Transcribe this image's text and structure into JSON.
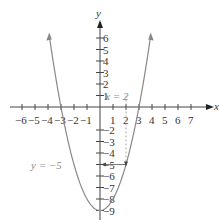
{
  "chart_data": {
    "type": "line",
    "title": "",
    "equation": "y = x^2 - 9",
    "xlabel": "x",
    "ylabel": "y",
    "xlim": [
      -7,
      7.5
    ],
    "ylim": [
      -9.5,
      7
    ],
    "x_ticks": [
      -6,
      -5,
      -4,
      -3,
      -2,
      -1,
      1,
      2,
      3,
      4,
      5,
      6,
      7
    ],
    "y_ticks": [
      6,
      5,
      4,
      3,
      2,
      1,
      -2,
      -3,
      -4,
      -5,
      -6,
      -7,
      -8,
      -9
    ],
    "grid": false,
    "series": [
      {
        "name": "parabola",
        "color": "#888888",
        "x": [
          -3.9,
          -3,
          -2,
          -1,
          0,
          1,
          2,
          3,
          3.9
        ],
        "y": [
          6.21,
          0,
          -5,
          -8,
          -9,
          -8,
          -5,
          0,
          6.21
        ]
      }
    ],
    "annotations": [
      {
        "label": "x = 2",
        "type": "dashed-vertical",
        "x": 2,
        "y_from": 1,
        "y_to": -5
      },
      {
        "label": "y = −5",
        "type": "arrow-horizontal",
        "y": -5,
        "x_from": 2,
        "x_to": 0
      }
    ]
  },
  "labels": {
    "x_axis": "x",
    "y_axis": "y",
    "x_eq_2": "x = 2",
    "y_eq_m5": "y = −5"
  }
}
